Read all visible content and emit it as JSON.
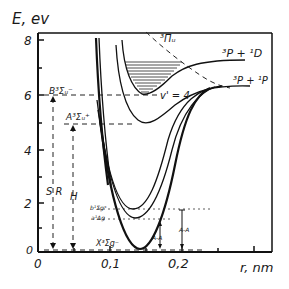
{
  "axes": {
    "y_label": "E, ev",
    "x_label": "r, nm",
    "y_ticks": [
      "0",
      "2",
      "4",
      "6",
      "8"
    ],
    "x_ticks": [
      "0",
      "0,1",
      "0,2"
    ]
  },
  "states": {
    "pi_u": "³Πᵤ",
    "asymptote_upper": "³P + ¹D",
    "asymptote_lower": "³P + ¹P",
    "B_state": "B³Σᵤ⁻",
    "A_state": "A³Σᵤ⁺",
    "b_state": "b¹Σg⁺",
    "a_state": "a¹Δg",
    "X_state": "X³Σg⁻",
    "vibrational_level": "v' = 4"
  },
  "annotations": {
    "SR": "S R",
    "H": "H",
    "AA_1": "A-A",
    "AA_2": "A-A"
  },
  "colors": {
    "ink": "#111111",
    "paper": "#ffffff"
  }
}
